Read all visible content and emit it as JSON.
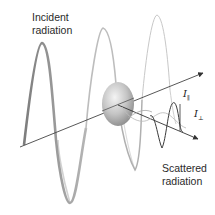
{
  "diagram": {
    "labels": {
      "incident": [
        "Incident",
        "radiation"
      ],
      "scattered": [
        "Scattered",
        "radiation"
      ],
      "i_parallel": {
        "symbol": "I",
        "subscript": "∥"
      },
      "i_perp": {
        "symbol": "I",
        "subscript": "⊥"
      }
    },
    "elements": {
      "incident_axis": {
        "from": [
          20,
          147
        ],
        "to": [
          203,
          73
        ],
        "arrowhead": true
      },
      "scattered_axis": {
        "from": [
          118,
          105
        ],
        "to": [
          198,
          139
        ],
        "arrowhead": true
      },
      "particle": {
        "shape": "sphere",
        "center": [
          118,
          104
        ],
        "rx": 16,
        "ry": 22
      },
      "incident_wave": "ribbon sinusoid along incident axis, fading from dark to light gray",
      "scattered_wave_parallel": "small dark sinusoid in vertical plane along scattered axis",
      "scattered_wave_perpendicular": "small light sinusoid in horizontal plane along scattered axis"
    },
    "colors": {
      "axis": "#444444",
      "ribbon_dark": "#8a8a8a",
      "ribbon_light": "#cfcfcf",
      "sphere_light": "#f2f2f2",
      "sphere_dark": "#8c8c8c",
      "text": "#2a2a2a"
    }
  }
}
